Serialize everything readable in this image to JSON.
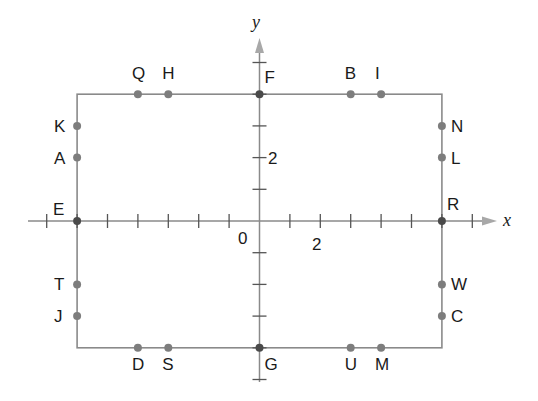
{
  "diagram": {
    "type": "coordinate-plane-rectangle",
    "axes": {
      "x_label": "x",
      "y_label": "y",
      "origin_label": "0",
      "x_tick_label": "2",
      "y_tick_label": "2",
      "x_ticks": [
        -7,
        -6,
        -5,
        -4,
        -3,
        -2,
        -1,
        0,
        1,
        2,
        3,
        4,
        5,
        6,
        7
      ],
      "y_ticks": [
        -5,
        -4,
        -3,
        -2,
        -1,
        0,
        1,
        2,
        3,
        4,
        5
      ]
    },
    "rectangle": {
      "x_min": -6,
      "x_max": 6,
      "y_min": -4,
      "y_max": 4
    },
    "points": [
      {
        "label": "Q",
        "x": -4,
        "y": 4,
        "label_pos": "above"
      },
      {
        "label": "H",
        "x": -3,
        "y": 4,
        "label_pos": "above"
      },
      {
        "label": "F",
        "x": 0,
        "y": 4,
        "label_pos": "above-right",
        "on_axis": true
      },
      {
        "label": "B",
        "x": 3,
        "y": 4,
        "label_pos": "above"
      },
      {
        "label": "I",
        "x": 4,
        "y": 4,
        "label_pos": "above"
      },
      {
        "label": "K",
        "x": -6,
        "y": 3,
        "label_pos": "left"
      },
      {
        "label": "A",
        "x": -6,
        "y": 2,
        "label_pos": "left"
      },
      {
        "label": "N",
        "x": 6,
        "y": 3,
        "label_pos": "right"
      },
      {
        "label": "L",
        "x": 6,
        "y": 2,
        "label_pos": "right"
      },
      {
        "label": "E",
        "x": -6,
        "y": 0,
        "label_pos": "above-left",
        "on_axis": true
      },
      {
        "label": "R",
        "x": 6,
        "y": 0,
        "label_pos": "above-right",
        "on_axis": true
      },
      {
        "label": "T",
        "x": -6,
        "y": -2,
        "label_pos": "left"
      },
      {
        "label": "J",
        "x": -6,
        "y": -3,
        "label_pos": "left"
      },
      {
        "label": "W",
        "x": 6,
        "y": -2,
        "label_pos": "right"
      },
      {
        "label": "C",
        "x": 6,
        "y": -3,
        "label_pos": "right"
      },
      {
        "label": "D",
        "x": -4,
        "y": -4,
        "label_pos": "below"
      },
      {
        "label": "S",
        "x": -3,
        "y": -4,
        "label_pos": "below"
      },
      {
        "label": "G",
        "x": 0,
        "y": -4,
        "label_pos": "below-right",
        "on_axis": true
      },
      {
        "label": "U",
        "x": 3,
        "y": -4,
        "label_pos": "below"
      },
      {
        "label": "M",
        "x": 4,
        "y": -4,
        "label_pos": "below"
      }
    ],
    "colors": {
      "axis": "#8a8a8a",
      "rectangle": "#8a8a8a",
      "point": "#7d7d7d",
      "axis_point": "#4a4a4a",
      "text": "#1a1a1a"
    }
  }
}
